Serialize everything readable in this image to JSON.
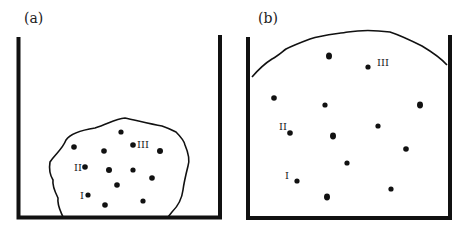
{
  "panels": [
    {
      "id": "a",
      "label": "(a)",
      "description": "Solid-like aggregate settled at bottom of container",
      "dot_labels": {
        "I": "I",
        "II": "II",
        "III": "III"
      }
    },
    {
      "id": "b",
      "label": "(b)",
      "description": "Particles dispersed filling the container",
      "dot_labels": {
        "I": "I",
        "II": "II",
        "III": "III"
      }
    }
  ],
  "colors": {
    "ink": "#111111",
    "background": "#ffffff"
  }
}
